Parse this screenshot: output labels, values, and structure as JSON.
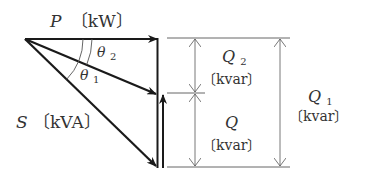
{
  "diagram": {
    "type": "power-triangle",
    "labels": {
      "P": {
        "symbol": "P",
        "unit": "〔kW〕"
      },
      "S": {
        "symbol": "S",
        "unit": "〔kVA〕"
      },
      "theta1": {
        "symbol": "θ",
        "sub": "1"
      },
      "theta2": {
        "symbol": "θ",
        "sub": "2"
      },
      "Q2": {
        "symbol": "Q",
        "sub": "2",
        "unit": "〔kvar〕"
      },
      "Q": {
        "symbol": "Q",
        "sub": "",
        "unit": "〔kvar〕"
      },
      "Q1": {
        "symbol": "Q",
        "sub": "1",
        "unit": "〔kvar〕"
      }
    },
    "colors": {
      "line": "#1a1a1a",
      "dimension": "#555555",
      "text": "#333333"
    }
  }
}
